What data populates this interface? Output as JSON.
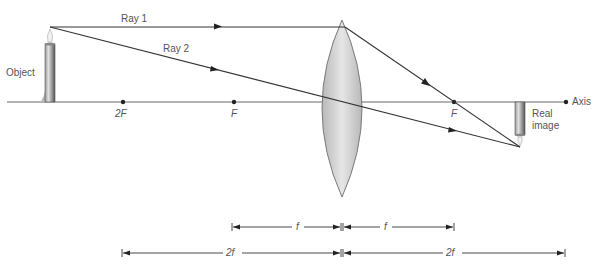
{
  "diagram": {
    "labels": {
      "object": "Object",
      "ray1": "Ray 1",
      "ray2": "Ray 2",
      "two_f_point": "2F",
      "f_left": "F",
      "f_right": "F",
      "axis": "Axis",
      "real_image_line1": "Real",
      "real_image_line2": "image"
    },
    "dimensions": {
      "f_left": "f",
      "f_right": "f",
      "two_f_left": "2f",
      "two_f_right": "2f"
    },
    "colors": {
      "ray": "#333333",
      "axis": "#999999",
      "lens_fill": "#cfcfcf",
      "lens_stroke": "#777777",
      "text": "#555555"
    }
  }
}
